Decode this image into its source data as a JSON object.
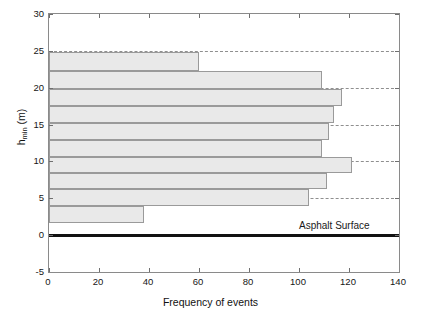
{
  "chart_data": {
    "type": "bar",
    "orientation": "horizontal",
    "title": "",
    "xlabel": "Frequency of events",
    "ylabel": "h_min (m)",
    "ylabel_base": "h",
    "ylabel_sub": "min",
    "ylabel_unit": " (m)",
    "xlim": [
      0,
      140
    ],
    "ylim": [
      -5,
      30
    ],
    "xticks": [
      0,
      20,
      40,
      60,
      80,
      100,
      120,
      140
    ],
    "yticks": [
      -5,
      0,
      5,
      10,
      15,
      20,
      25,
      30
    ],
    "grid": "horizontal-dashed",
    "gridlines_y": [
      5,
      10,
      15,
      20,
      25
    ],
    "legend": "none",
    "bar_color": "#e9e9e9",
    "bar_edge_color": "#9a9a9a",
    "bins": [
      {
        "y_low": 1.6,
        "y_high": 3.9,
        "value": 38
      },
      {
        "y_low": 3.9,
        "y_high": 6.2,
        "value": 104
      },
      {
        "y_low": 6.2,
        "y_high": 8.4,
        "value": 111
      },
      {
        "y_low": 8.4,
        "y_high": 10.6,
        "value": 121
      },
      {
        "y_low": 10.6,
        "y_high": 12.9,
        "value": 109
      },
      {
        "y_low": 12.9,
        "y_high": 15.2,
        "value": 112
      },
      {
        "y_low": 15.2,
        "y_high": 17.5,
        "value": 114
      },
      {
        "y_low": 17.5,
        "y_high": 19.8,
        "value": 117
      },
      {
        "y_low": 19.8,
        "y_high": 22.2,
        "value": 109
      },
      {
        "y_low": 22.2,
        "y_high": 24.8,
        "value": 60
      }
    ],
    "annotations": [
      {
        "name": "asphalt-surface",
        "text": "Asphalt Surface",
        "y": 0,
        "x": 100
      }
    ]
  }
}
